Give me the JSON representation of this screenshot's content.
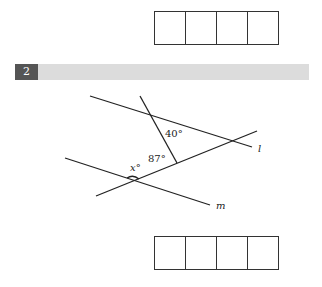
{
  "question": {
    "number": "2",
    "labels": {
      "angle_top": "40°",
      "angle_mid": "87°",
      "angle_x": "x°",
      "line_l": "l",
      "line_m": "m"
    }
  },
  "answer_boxes": {
    "top_cells": 4,
    "bottom_cells": 4
  },
  "colors": {
    "bar": "#dcdcdc",
    "number_bg": "#555555"
  }
}
